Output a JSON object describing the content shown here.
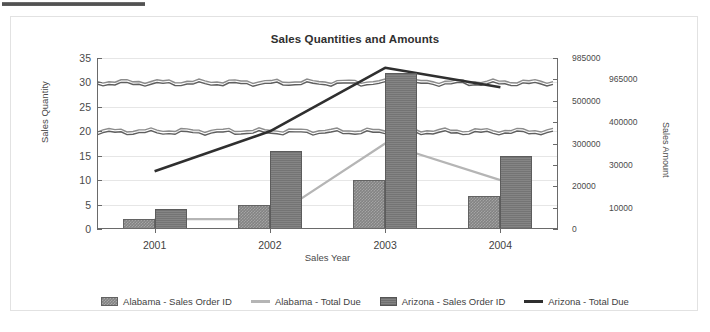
{
  "chart": {
    "title": "Sales Quantities and Amounts",
    "xlabel": "Sales Year",
    "ylabel_left": "Sales Quantity",
    "ylabel_right": "Sales Amount"
  },
  "legend": {
    "items": [
      {
        "label": "Alabama - Sales Order ID",
        "marker": "bar-swatch-light",
        "color": "#838383"
      },
      {
        "label": "Alabama - Total Due",
        "marker": "line-swatch-light",
        "color": "#b5b5b5"
      },
      {
        "label": "Arizona - Sales Order ID",
        "marker": "bar-swatch-dark",
        "color": "#747474"
      },
      {
        "label": "Arizona - Total Due",
        "marker": "line-swatch-dark",
        "color": "#2f2f2f"
      }
    ]
  },
  "axes": {
    "left_ticks": [
      "0",
      "5",
      "10",
      "15",
      "20",
      "25",
      "30",
      "35"
    ],
    "right_ticks": [
      "0",
      "10000",
      "20000",
      "30000",
      "300000",
      "400000",
      "500000",
      "965000",
      "985000"
    ],
    "x_ticks": [
      "2001",
      "2002",
      "2003",
      "2004"
    ]
  },
  "chart_data": {
    "type": "bar",
    "title": "Sales Quantities and Amounts",
    "xlabel": "Sales Year",
    "ylabel": "Sales Quantity",
    "ylabel_secondary": "Sales Amount",
    "categories": [
      "2001",
      "2002",
      "2003",
      "2004"
    ],
    "ylim": [
      0,
      35
    ],
    "ytick_step": 5,
    "yticks": [
      0,
      5,
      10,
      15,
      20,
      25,
      30,
      35
    ],
    "y2ticks": [
      0,
      10000,
      20000,
      30000,
      300000,
      400000,
      500000,
      965000,
      985000
    ],
    "y2lim": [
      0,
      985000
    ],
    "grid": true,
    "legend_position": "bottom",
    "series": [
      {
        "name": "Alabama - Sales Order ID",
        "kind": "bar",
        "axis": "left",
        "color": "#838383",
        "values": [
          2,
          5,
          10,
          6.7
        ]
      },
      {
        "name": "Arizona - Sales Order ID",
        "kind": "bar",
        "axis": "left",
        "color": "#747474",
        "values": [
          4,
          16,
          32,
          15
        ]
      },
      {
        "name": "Alabama - Total Due",
        "kind": "line",
        "axis": "right",
        "color": "#b5b5b5",
        "values_quantity_scale": [
          2,
          2,
          17.5,
          10
        ],
        "values": [
          4000,
          4000,
          35000,
          20000
        ]
      },
      {
        "name": "Arizona - Total Due",
        "kind": "line",
        "axis": "right",
        "color": "#2f2f2f",
        "values_quantity_scale": [
          11.8,
          20,
          33,
          29
        ],
        "values": [
          23500,
          300000,
          980000,
          960000
        ]
      }
    ],
    "noise_bands": [
      {
        "name": "upper-band",
        "quantity_level": 29.8,
        "color": "#7e7e7e"
      },
      {
        "name": "lower-band",
        "quantity_level": 19.8,
        "color": "#6f6f6f"
      }
    ]
  }
}
